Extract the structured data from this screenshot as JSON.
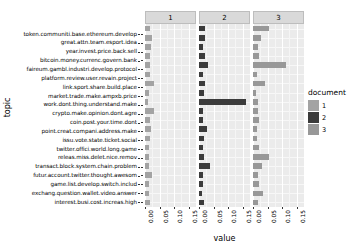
{
  "chart_data": {
    "type": "bar",
    "title": "",
    "xlabel": "value",
    "ylabel": "topic",
    "xlim": [
      0,
      0.175
    ],
    "xticks": [
      0.0,
      0.05,
      0.1,
      0.15
    ],
    "xtick_labels": [
      "0.00",
      "0.05",
      "0.10",
      "0.15"
    ],
    "grid": true,
    "orientation": "horizontal",
    "facet_by": "document",
    "facets": [
      "1",
      "2",
      "3"
    ],
    "legend_title": "document",
    "legend_position": "right",
    "legend_entries": [
      {
        "label": "1",
        "color": "#a3a3a3"
      },
      {
        "label": "2",
        "color": "#3b3b3b"
      },
      {
        "label": "3",
        "color": "#989898"
      }
    ],
    "categories": [
      "token.communiti.base.ethereum.develop",
      "great.attn.team.esport.idea",
      "year.invest.price.back.sell",
      "bitcoin.money.currenc.govern.bank",
      "faireum.gambl.industri.develop.protocol",
      "platform.review.user.revain.project",
      "link.sport.share.build.place",
      "market.trade.make.ampxb.price",
      "work.dont.thing.understand.make",
      "crypto.make.opinion.dont.agre",
      "coin.post.your.time.dont",
      "point.creat.compani.address.make",
      "issu.vote.state.ticket.social",
      "twitter.offici.world.long.game",
      "releas.miss.delet.nice.remov",
      "transact.block.system.chain.problem",
      "futur.account.twitter.thought.awesom",
      "game.list.develop.switch.includ",
      "exchang.question.wallet.video.answer",
      "interest.busi.cost.increas.high"
    ],
    "series": [
      {
        "name": "1",
        "color": "#a3a3a3",
        "values": [
          0.018,
          0.024,
          0.019,
          0.018,
          0.017,
          0.016,
          0.03,
          0.014,
          0.012,
          0.032,
          0.016,
          0.021,
          0.016,
          0.014,
          0.014,
          0.015,
          0.024,
          0.013,
          0.013,
          0.016
        ]
      },
      {
        "name": "2",
        "color": "#3b3b3b",
        "values": [
          0.021,
          0.019,
          0.013,
          0.02,
          0.031,
          0.013,
          0.019,
          0.016,
          0.16,
          0.013,
          0.013,
          0.029,
          0.016,
          0.015,
          0.017,
          0.037,
          0.015,
          0.013,
          0.012,
          0.016
        ]
      },
      {
        "name": "3",
        "color": "#989898",
        "values": [
          0.056,
          0.026,
          0.018,
          0.019,
          0.113,
          0.013,
          0.04,
          0.012,
          0.016,
          0.016,
          0.022,
          0.013,
          0.014,
          0.021,
          0.055,
          0.032,
          0.016,
          0.019,
          0.033,
          0.016
        ]
      }
    ]
  }
}
